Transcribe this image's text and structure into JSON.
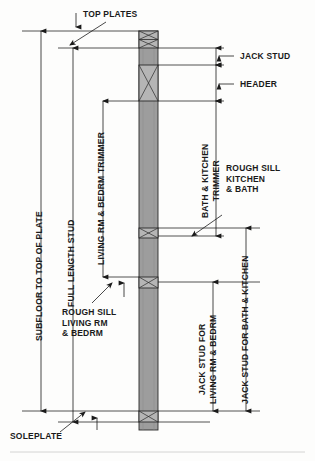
{
  "diagram": {
    "background_color": "#fdfdfc",
    "line_color": "#1a1a1a",
    "stud_fill_color": "#9d9d9d",
    "block_fill_color": "#b5b5b5"
  },
  "labels": {
    "top_plates": "TOP PLATES",
    "jack_stud": "JACK STUD",
    "header": "HEADER",
    "rough_sill_kitchen_bath": "ROUGH SILL\nKITCHEN\n& BATH",
    "rough_sill_living_bedrm": "ROUGH SILL\nLIVING RM\n& BEDRM",
    "soleplate": "SOLEPLATE",
    "subfloor_to_top_of_plate": "SUBFLOOR TO TOP OF PLATE",
    "full_length_stud": "FULL LENGTH STUD",
    "living_bedrm_trimmer": "LIVING RM & BEDRM TRIMMER",
    "bath_kitchen_trimmer": "BATH & KITCHEN\nTRIMMER",
    "jack_stud_living_bedrm": "JACK STUD FOR\nLIVING RM & BEDRM",
    "jack_stud_bath_kitchen": "JACK STUD FOR BATH & KITCHEN"
  }
}
